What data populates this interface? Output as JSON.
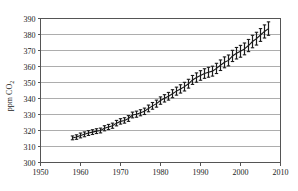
{
  "chart_data": {
    "type": "line",
    "title": "",
    "subtitle": "",
    "xlabel": "",
    "ylabel": "ppm CO2",
    "ylabel_main": "ppm CO",
    "ylabel_subscript": "2",
    "xlim": [
      1950,
      2010
    ],
    "ylim": [
      300,
      390
    ],
    "xticks": [
      1950,
      1960,
      1970,
      1980,
      1990,
      2000,
      2010
    ],
    "yticks": [
      300,
      310,
      320,
      330,
      340,
      350,
      360,
      370,
      380,
      390
    ],
    "xtick_labels": [
      "1950",
      "1960",
      "1970",
      "1980",
      "1990",
      "2000",
      "2010"
    ],
    "ytick_labels": [
      "300",
      "310",
      "320",
      "330",
      "340",
      "350",
      "360",
      "370",
      "380",
      "390"
    ],
    "grid": "horizontal",
    "legend": "none",
    "series_name": "Mauna Loa atmospheric CO2 annual mean with seasonal range",
    "marker_style": "vertical-range-bar-with-caps",
    "line_color": "#1a1a1a",
    "grid_color": "#999999",
    "frame_color": "#555555",
    "background_color": "#ffffff",
    "x": [
      1958,
      1959,
      1960,
      1961,
      1962,
      1963,
      1964,
      1965,
      1966,
      1967,
      1968,
      1969,
      1970,
      1971,
      1972,
      1973,
      1974,
      1975,
      1976,
      1977,
      1978,
      1979,
      1980,
      1981,
      1982,
      1983,
      1984,
      1985,
      1986,
      1987,
      1988,
      1989,
      1990,
      1991,
      1992,
      1993,
      1994,
      1995,
      1996,
      1997,
      1998,
      1999,
      2000,
      2001,
      2002,
      2003,
      2004,
      2005,
      2006,
      2007
    ],
    "values": [
      315.3,
      315.9,
      316.9,
      317.6,
      318.4,
      319.0,
      319.6,
      320.0,
      321.4,
      322.2,
      323.0,
      324.6,
      325.7,
      326.3,
      327.5,
      329.7,
      330.2,
      331.1,
      332.0,
      333.8,
      335.4,
      336.8,
      338.7,
      340.1,
      341.4,
      343.0,
      344.6,
      346.0,
      347.4,
      349.2,
      351.6,
      353.1,
      354.4,
      355.6,
      356.4,
      357.1,
      358.8,
      360.8,
      362.6,
      363.8,
      366.6,
      368.3,
      369.5,
      371.0,
      373.1,
      375.6,
      377.4,
      379.7,
      381.9,
      383.7
    ],
    "error_low": [
      314.2,
      314.5,
      315.4,
      316.1,
      316.9,
      317.5,
      318.1,
      318.5,
      319.8,
      320.6,
      321.4,
      322.9,
      324.0,
      324.6,
      325.7,
      327.9,
      328.3,
      329.2,
      330.0,
      331.7,
      333.3,
      334.6,
      336.4,
      337.8,
      339.0,
      340.5,
      342.1,
      343.4,
      344.7,
      346.5,
      348.8,
      350.2,
      351.4,
      352.6,
      353.3,
      354.0,
      355.6,
      357.5,
      359.2,
      360.4,
      363.1,
      364.7,
      365.8,
      367.3,
      369.3,
      371.7,
      373.4,
      375.7,
      377.8,
      379.5
    ],
    "error_high": [
      316.6,
      317.3,
      318.4,
      319.1,
      319.9,
      320.5,
      321.1,
      321.5,
      323.0,
      323.8,
      324.6,
      326.3,
      327.4,
      328.0,
      329.3,
      331.5,
      332.1,
      333.0,
      334.0,
      335.9,
      337.5,
      339.0,
      341.0,
      342.4,
      343.8,
      345.5,
      347.1,
      348.6,
      350.1,
      352.0,
      354.4,
      356.0,
      357.4,
      358.6,
      359.5,
      360.2,
      362.0,
      364.1,
      366.0,
      367.2,
      370.1,
      371.9,
      373.2,
      374.7,
      376.9,
      379.5,
      381.4,
      383.7,
      386.0,
      387.9
    ]
  }
}
